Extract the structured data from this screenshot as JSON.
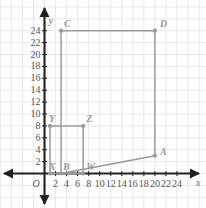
{
  "chart_data": {
    "type": "scatter",
    "title": "",
    "subtitle": "",
    "xlabel": "x",
    "ylabel": "y",
    "origin_label": "O",
    "xlim": [
      0,
      25.6
    ],
    "ylim": [
      0,
      25.6
    ],
    "grid": true,
    "grid_step": 2,
    "legend": "none",
    "xticks": [
      2,
      4,
      6,
      8,
      10,
      12,
      14,
      16,
      18,
      20,
      22,
      24
    ],
    "yticks": [
      2,
      4,
      6,
      8,
      10,
      12,
      14,
      16,
      18,
      20,
      22,
      24
    ],
    "xtick_labels": [
      "2",
      "4",
      "6",
      "8",
      "10",
      "12",
      "14",
      "16",
      "18",
      "20",
      "22",
      "24"
    ],
    "ytick_labels": [
      "2",
      "4",
      "6",
      "8",
      "10",
      "12",
      "14",
      "16",
      "18",
      "20",
      "22",
      "24"
    ],
    "annotations": [
      {
        "label": "A",
        "x": 20,
        "y": 3,
        "label_dx": 5,
        "label_dy": -9
      },
      {
        "label": "B",
        "x": 3,
        "y": 0,
        "label_dx": 2,
        "label_dy": -12
      },
      {
        "label": "C",
        "x": 3,
        "y": 24,
        "label_dx": 3,
        "label_dy": -12
      },
      {
        "label": "D",
        "x": 20,
        "y": 24,
        "label_dx": 5,
        "label_dy": -12
      },
      {
        "label": "W",
        "x": 7,
        "y": 0,
        "label_dx": 3,
        "label_dy": -12
      },
      {
        "label": "X",
        "x": 1,
        "y": 0,
        "label_dx": -1,
        "label_dy": -12
      },
      {
        "label": "Y",
        "x": 1,
        "y": 8,
        "label_dx": -1,
        "label_dy": -12
      },
      {
        "label": "Z",
        "x": 7,
        "y": 8,
        "label_dx": 3,
        "label_dy": -12
      }
    ],
    "series": [
      {
        "name": "quadrilateral-ABDC",
        "type": "polygon",
        "closed": true,
        "color": "#9a9a9c",
        "points": [
          [
            3,
            0
          ],
          [
            20,
            3
          ],
          [
            20,
            24
          ],
          [
            3,
            24
          ]
        ],
        "vertex_labels": [
          "B",
          "A",
          "D",
          "C"
        ]
      },
      {
        "name": "quadrilateral-XWZY",
        "type": "polygon",
        "closed": true,
        "color": "#9a9a9c",
        "points": [
          [
            1,
            0
          ],
          [
            7,
            0
          ],
          [
            7,
            8
          ],
          [
            1,
            8
          ]
        ],
        "vertex_labels": [
          "X",
          "W",
          "Z",
          "Y"
        ]
      }
    ],
    "colors": {
      "axis": "#231f20",
      "shape_stroke": "#9a9a9c",
      "point_fill": "#9a9a9c",
      "grid": "#e9e9ed",
      "tick_text": "#58585a",
      "point_label": "#9a9a9c"
    }
  }
}
